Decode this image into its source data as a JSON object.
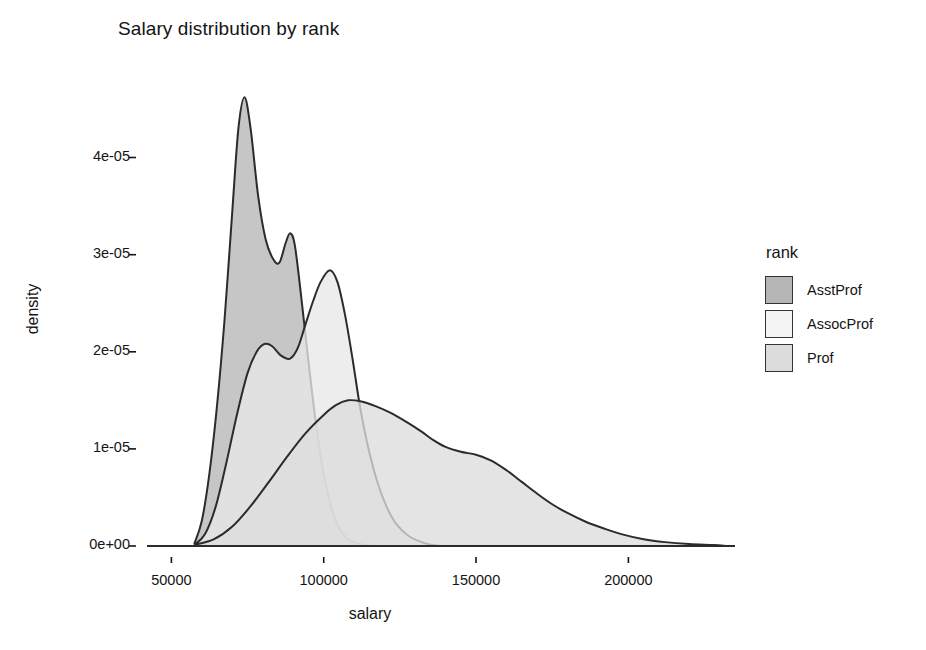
{
  "chart_data": {
    "type": "area",
    "title": "Salary distribution by rank",
    "xlabel": "salary",
    "ylabel": "density",
    "xlim": [
      42000,
      235000
    ],
    "ylim": [
      0,
      4.85e-05
    ],
    "xticks": [
      50000,
      100000,
      150000,
      200000
    ],
    "xtick_labels": [
      "50000",
      "100000",
      "150000",
      "200000"
    ],
    "yticks": [
      0,
      1e-05,
      2e-05,
      3e-05,
      4e-05
    ],
    "ytick_labels": [
      "0e+00",
      "1e-05",
      "2e-05",
      "3e-05",
      "4e-05"
    ],
    "grid": false,
    "legend_position": "right",
    "legend_title": "rank",
    "series": [
      {
        "name": "AsstProf",
        "fill": "#b6b6b6",
        "stroke": "#2b2b2b",
        "peak_x": 74000,
        "peak_y": 4.62e-05,
        "points": [
          [
            57500,
            2e-07
          ],
          [
            60000,
            2.6e-06
          ],
          [
            62500,
            7.5e-06
          ],
          [
            65000,
            1.45e-05
          ],
          [
            67500,
            2.35e-05
          ],
          [
            70000,
            3.45e-05
          ],
          [
            72000,
            4.3e-05
          ],
          [
            74000,
            4.62e-05
          ],
          [
            76000,
            4.3e-05
          ],
          [
            78500,
            3.6e-05
          ],
          [
            81000,
            3.15e-05
          ],
          [
            83500,
            2.95e-05
          ],
          [
            85500,
            2.92e-05
          ],
          [
            87500,
            3.12e-05
          ],
          [
            89000,
            3.22e-05
          ],
          [
            90500,
            3.1e-05
          ],
          [
            92500,
            2.6e-05
          ],
          [
            95000,
            1.9e-05
          ],
          [
            97500,
            1.25e-05
          ],
          [
            100000,
            7.4e-06
          ],
          [
            102500,
            4e-06
          ],
          [
            105000,
            1.9e-06
          ],
          [
            108000,
            7e-07
          ],
          [
            112000,
            2e-07
          ],
          [
            116000,
            0.0
          ]
        ]
      },
      {
        "name": "AssocProf",
        "fill": "#e8e8e8",
        "stroke": "#2b2b2b",
        "peak_x": 102000,
        "peak_y": 2.84e-05,
        "points": [
          [
            57500,
            1e-07
          ],
          [
            61000,
            1.2e-06
          ],
          [
            64500,
            4e-06
          ],
          [
            68000,
            8.5e-06
          ],
          [
            71500,
            1.35e-05
          ],
          [
            75000,
            1.78e-05
          ],
          [
            78000,
            2e-05
          ],
          [
            80500,
            2.08e-05
          ],
          [
            83000,
            2.06e-05
          ],
          [
            86000,
            1.96e-05
          ],
          [
            89000,
            1.93e-05
          ],
          [
            91500,
            2.04e-05
          ],
          [
            94000,
            2.28e-05
          ],
          [
            96500,
            2.52e-05
          ],
          [
            99000,
            2.72e-05
          ],
          [
            102000,
            2.84e-05
          ],
          [
            104500,
            2.72e-05
          ],
          [
            107000,
            2.38e-05
          ],
          [
            109500,
            1.92e-05
          ],
          [
            112000,
            1.42e-05
          ],
          [
            115000,
            9.6e-06
          ],
          [
            118000,
            6.2e-06
          ],
          [
            121000,
            3.8e-06
          ],
          [
            124000,
            2.2e-06
          ],
          [
            128000,
            1e-06
          ],
          [
            133000,
            3e-07
          ],
          [
            138000,
            0.0
          ]
        ]
      },
      {
        "name": "Prof",
        "fill": "#dcdcdc",
        "stroke": "#2b2b2b",
        "peak_x": 108000,
        "peak_y": 1.5e-05,
        "points": [
          [
            57500,
            1e-07
          ],
          [
            64000,
            7e-07
          ],
          [
            70000,
            2e-06
          ],
          [
            76000,
            4.1e-06
          ],
          [
            82000,
            6.6e-06
          ],
          [
            88000,
            9.2e-06
          ],
          [
            94000,
            1.16e-05
          ],
          [
            100000,
            1.35e-05
          ],
          [
            104000,
            1.45e-05
          ],
          [
            108000,
            1.5e-05
          ],
          [
            112000,
            1.49e-05
          ],
          [
            117000,
            1.44e-05
          ],
          [
            122000,
            1.37e-05
          ],
          [
            127000,
            1.28e-05
          ],
          [
            132000,
            1.18e-05
          ],
          [
            136000,
            1.09e-05
          ],
          [
            140000,
            1.02e-05
          ],
          [
            145000,
            9.7e-06
          ],
          [
            150000,
            9.4e-06
          ],
          [
            155000,
            8.8e-06
          ],
          [
            160000,
            7.8e-06
          ],
          [
            165000,
            6.6e-06
          ],
          [
            170000,
            5.4e-06
          ],
          [
            175000,
            4.3e-06
          ],
          [
            180000,
            3.4e-06
          ],
          [
            186000,
            2.5e-06
          ],
          [
            192000,
            1.8e-06
          ],
          [
            198000,
            1.2e-06
          ],
          [
            205000,
            7e-07
          ],
          [
            212000,
            4e-07
          ],
          [
            220000,
            2e-07
          ],
          [
            228000,
            1e-07
          ],
          [
            232000,
            0.0
          ]
        ]
      }
    ]
  },
  "legend": {
    "title": "rank",
    "items": [
      {
        "label": "AsstProf",
        "swatch": "#b6b6b6"
      },
      {
        "label": "AssocProf",
        "swatch": "#f4f4f4"
      },
      {
        "label": "Prof",
        "swatch": "#dcdcdc"
      }
    ]
  },
  "colors": {
    "background": "#ffffff",
    "axis_text": "#141414",
    "curve_stroke": "#2b2b2b"
  }
}
